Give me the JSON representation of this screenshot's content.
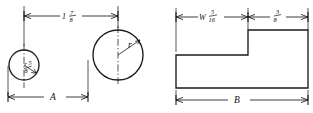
{
  "drawing": {
    "title": "Two-view mechanical part detail drawing",
    "ink_color": "#1b1b1b",
    "background_color": "#ffffff"
  },
  "left_view": {
    "name": "front-view",
    "small_circle": {
      "label_letter": "r",
      "radius_fraction_numerator": "5",
      "radius_fraction_denominator": "8"
    },
    "large_circle": {
      "label_letter": "r"
    },
    "top_dimension": {
      "whole": "1",
      "numerator": "7",
      "denominator": "8"
    },
    "bottom_dimension": {
      "label": "A"
    }
  },
  "right_view": {
    "name": "side-view",
    "top_dimension_left": {
      "whole": "W",
      "numerator": "5",
      "denominator": "16"
    },
    "top_dimension_right": {
      "numerator": "3",
      "denominator": "8"
    },
    "bottom_dimension": {
      "label": "B"
    }
  }
}
